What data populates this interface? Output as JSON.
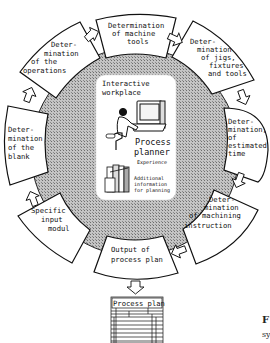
{
  "diagram": {
    "center": {
      "title_lines": [
        "Interactive",
        "workplace"
      ],
      "planner_lines": [
        "Process",
        "planner"
      ],
      "experience": "Experience",
      "info_lines": [
        "Additional",
        "information",
        "for planning"
      ]
    },
    "steps": [
      {
        "id": "machine-tools",
        "lines": [
          "Determination",
          "of machine",
          "tools"
        ]
      },
      {
        "id": "jigs-fixtures-tools",
        "lines": [
          "Deter-",
          "mination",
          "of jigs,",
          "fixtures",
          "and tools"
        ]
      },
      {
        "id": "estimated-time",
        "lines": [
          "Deter-",
          "mination,",
          "of",
          "estimated",
          "time"
        ]
      },
      {
        "id": "machining-instruction",
        "lines": [
          "Deter-",
          "mination",
          "of machining",
          "instruction"
        ]
      },
      {
        "id": "output-process-plan",
        "lines": [
          "Output of",
          "process plan"
        ]
      },
      {
        "id": "specific-input",
        "lines": [
          "Specific",
          "input",
          "modul"
        ]
      },
      {
        "id": "blank",
        "lines": [
          "Deter-",
          "mination",
          "of the",
          "blank"
        ]
      },
      {
        "id": "operations",
        "lines": [
          "Deter-",
          "mination",
          "of the",
          "operations"
        ]
      }
    ],
    "output_document": {
      "title": "Process plan"
    },
    "caption_fragment": {
      "line1": "F",
      "line2": "sy"
    }
  }
}
